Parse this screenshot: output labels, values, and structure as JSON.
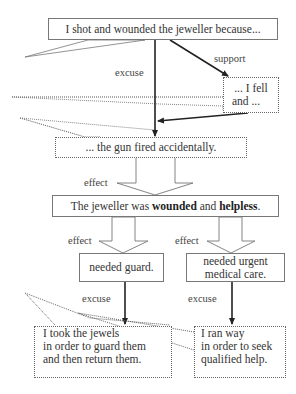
{
  "diagram": {
    "type": "argument-map",
    "nodes": {
      "claim": "I shot and wounded the jeweller because...",
      "fell": "... I fell and ...",
      "fell_line1": "... I fell",
      "fell_line2": "and ...",
      "gun": "... the gun fired accidentally.",
      "jeweller_pre": "The jeweller was ",
      "jeweller_b1": "wounded",
      "jeweller_mid": " and ",
      "jeweller_b2": "helpless",
      "jeweller_post": ".",
      "guard": "needed guard.",
      "medical_line1": "needed urgent",
      "medical_line2": "medical care.",
      "jewels_line1": "I took the jewels",
      "jewels_line2": "in order to guard them",
      "jewels_line3": "and then return them.",
      "ran_line1": "I ran way",
      "ran_line2": "in order to seek",
      "ran_line3": "qualified help."
    },
    "edge_labels": {
      "excuse_top": "excuse",
      "support": "support",
      "effect_center": "effect",
      "effect_left": "effect",
      "effect_right": "effect",
      "excuse_left": "excuse",
      "excuse_right": "excuse"
    },
    "colors": {
      "line": "#222222",
      "border": "#777777",
      "text": "#333333"
    }
  }
}
